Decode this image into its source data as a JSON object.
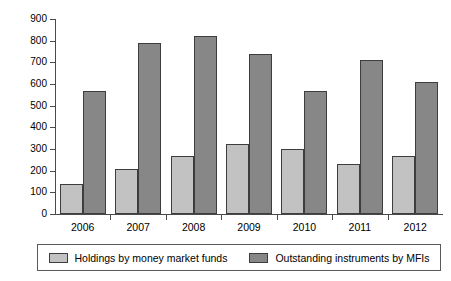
{
  "chart_data": {
    "type": "bar",
    "title": "",
    "xlabel": "",
    "ylabel": "",
    "categories": [
      "2006",
      "2007",
      "2008",
      "2009",
      "2010",
      "2011",
      "2012"
    ],
    "series": [
      {
        "name": "Holdings by money market funds",
        "color": "#c2c2c2",
        "values": [
          140,
          210,
          266,
          322,
          298,
          233,
          270
        ]
      },
      {
        "name": "Outstanding instruments by MFIs",
        "color": "#878787",
        "values": [
          570,
          788,
          821,
          737,
          570,
          709,
          611
        ]
      }
    ],
    "ylim": [
      0,
      900
    ],
    "ytick_step": 100,
    "yticks": [
      "0",
      "100",
      "200",
      "300",
      "400",
      "500",
      "600",
      "700",
      "800",
      "900"
    ],
    "grid": false,
    "legend_position": "bottom"
  },
  "legend": {
    "entries": [
      {
        "label": "Holdings by money market funds"
      },
      {
        "label": "Outstanding instruments by MFIs"
      }
    ]
  }
}
